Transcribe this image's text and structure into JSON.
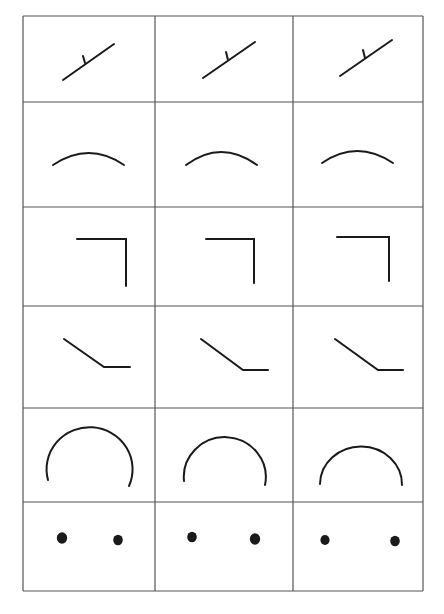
{
  "figure": {
    "header_fragment": "",
    "grid": {
      "rows": 6,
      "cols": 3,
      "col_x": [
        23,
        155,
        293,
        423
      ],
      "row_y": [
        16,
        102,
        207,
        306,
        408,
        502,
        591
      ],
      "line_color": "#555555",
      "stroke_color": "#1a1a1a"
    },
    "rows": [
      {
        "name": "line-with-tick",
        "cells": [
          {
            "line": [
              63,
              80,
              114,
              44
            ],
            "tick": [
              85,
              63,
              83,
              56
            ]
          },
          {
            "line": [
              203,
              78,
              255,
              42
            ],
            "tick": [
              228,
              60,
              226,
              52
            ]
          },
          {
            "line": [
              340,
              76,
              392,
              40
            ],
            "tick": [
              365,
              58,
              363,
              50
            ]
          }
        ]
      },
      {
        "name": "shallow-arc",
        "cells": [
          {
            "start": [
              53,
              165
            ],
            "ctrl": [
              89,
              141
            ],
            "end": [
              124,
              165
            ]
          },
          {
            "start": [
              186,
              165
            ],
            "ctrl": [
              221,
              139
            ],
            "end": [
              257,
              165
            ]
          },
          {
            "start": [
              322,
              163
            ],
            "ctrl": [
              357,
              139
            ],
            "end": [
              393,
              163
            ]
          }
        ]
      },
      {
        "name": "right-angle-corner",
        "cells": [
          {
            "points": [
              [
                77,
                239
              ],
              [
                126,
                239
              ],
              [
                126,
                286
              ]
            ]
          },
          {
            "points": [
              [
                206,
                239
              ],
              [
                254,
                239
              ],
              [
                254,
                283
              ]
            ]
          },
          {
            "points": [
              [
                337,
                237
              ],
              [
                389,
                237
              ],
              [
                389,
                281
              ]
            ]
          }
        ]
      },
      {
        "name": "bent-line",
        "cells": [
          {
            "points": [
              [
                64,
                339
              ],
              [
                104,
                367
              ],
              [
                130,
                367
              ]
            ]
          },
          {
            "points": [
              [
                201,
                339
              ],
              [
                243,
                370
              ],
              [
                268,
                370
              ]
            ]
          },
          {
            "points": [
              [
                335,
                339
              ],
              [
                378,
                370
              ],
              [
                403,
                370
              ]
            ]
          }
        ]
      },
      {
        "name": "large-arc",
        "cells": [
          {
            "start": [
              48,
              480
            ],
            "end": [
              129,
              486
            ],
            "rx": 43,
            "ry": 42
          },
          {
            "start": [
              184,
              481
            ],
            "end": [
              265,
              485
            ],
            "rx": 41,
            "ry": 40
          },
          {
            "start": [
              320,
              484
            ],
            "end": [
              402,
              485
            ],
            "rx": 41,
            "ry": 38
          }
        ]
      },
      {
        "name": "two-dots",
        "cells": [
          {
            "dots": [
              [
                62,
                538,
                5.2
              ],
              [
                118,
                540,
                4.8
              ]
            ]
          },
          {
            "dots": [
              [
                192,
                537,
                4.8
              ],
              [
                255,
                539,
                5.2
              ]
            ]
          },
          {
            "dots": [
              [
                325,
                540,
                4.6
              ],
              [
                395,
                541,
                4.8
              ]
            ]
          }
        ]
      }
    ]
  }
}
